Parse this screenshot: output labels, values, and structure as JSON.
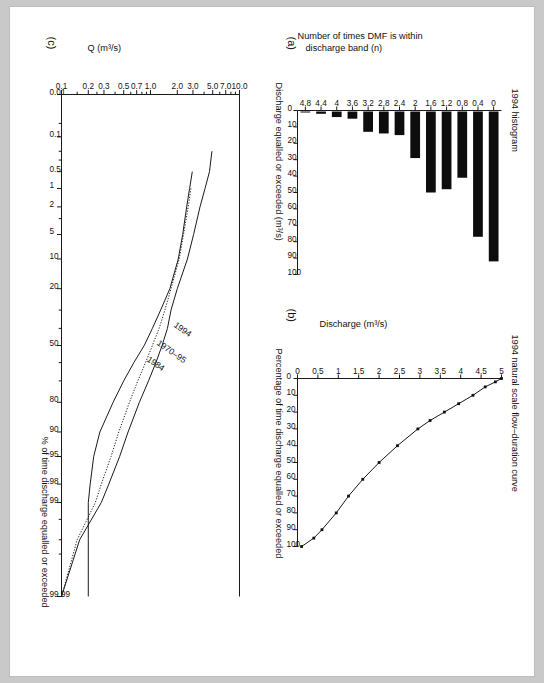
{
  "figure": {
    "orientation_deg": 90,
    "background": "#c9c9c9",
    "paper": "#ffffff",
    "ink": "#1a1a1a"
  },
  "panel_a": {
    "tag": "(a)",
    "title": "1994 histogram",
    "ylabel_line1": "Number of times DMF is within",
    "ylabel_line2": "discharge band (n)",
    "xlabel": "Discharge equalled or exceeded (m³/s)",
    "chart_data": {
      "type": "bar",
      "title": "1994 histogram",
      "xlabel": "Discharge equalled or exceeded (m³/s)",
      "ylabel": "Number of times DMF is within discharge band (n)",
      "categories": [
        "0",
        "0.4",
        "0.8",
        "1.2",
        "1.6",
        "2",
        "2.4",
        "2.8",
        "3.2",
        "3.6",
        "4",
        "4.4",
        "4.8"
      ],
      "values": [
        92,
        77,
        41,
        48,
        50,
        29,
        15,
        14,
        13,
        5,
        4,
        2,
        1
      ],
      "ylim": [
        0,
        100
      ],
      "yticks": [
        0,
        10,
        20,
        30,
        40,
        50,
        60,
        70,
        80,
        90,
        100
      ],
      "xticks": [
        "0",
        "0.4",
        "0.8",
        "1.2",
        "1.6",
        "2",
        "2.4",
        "2.8",
        "3.2",
        "3.6",
        "4",
        "4.4",
        "4.8"
      ],
      "grid": false,
      "legend": "none"
    }
  },
  "panel_b": {
    "tag": "(b)",
    "title": "1994 natural scale flow–duration curve",
    "ylabel": "Discharge (m³/s)",
    "xlabel": "Percentage of time discharge equalled or exceeded",
    "chart_data": {
      "type": "line",
      "title": "1994 natural scale flow–duration curve",
      "xlabel": "Percentage of time discharge equalled or exceeded",
      "ylabel": "Discharge (m³/s)",
      "xlim": [
        0,
        100
      ],
      "ylim": [
        0,
        5
      ],
      "xticks": [
        0,
        10,
        20,
        30,
        40,
        50,
        60,
        70,
        80,
        90,
        100
      ],
      "yticks": [
        "0",
        "0.5",
        "1",
        "1.5",
        "2",
        "2.5",
        "3",
        "3.5",
        "4",
        "4.5",
        "5"
      ],
      "grid": false,
      "legend": "none",
      "series": [
        {
          "name": "1994",
          "x": [
            0,
            2,
            5,
            10,
            15,
            20,
            25,
            30,
            40,
            50,
            60,
            70,
            80,
            90,
            95,
            100
          ],
          "y": [
            5.0,
            4.85,
            4.6,
            4.3,
            3.95,
            3.6,
            3.25,
            2.95,
            2.45,
            2.0,
            1.6,
            1.25,
            0.95,
            0.6,
            0.4,
            0.1
          ]
        }
      ]
    }
  },
  "panel_c": {
    "tag": "(c)",
    "ylabel": "Q (m³/s)",
    "xlabel": "% of time discharge equalled or exceeded",
    "chart_data": {
      "type": "line",
      "title": "",
      "xlabel": "% of time discharge equalled or exceeded",
      "ylabel": "Q (m³/s)",
      "x_scale": "normal-probability",
      "y_scale": "log",
      "xlim": [
        0.01,
        99.99
      ],
      "ylim": [
        0.1,
        10.0
      ],
      "xticks": [
        "0.01",
        "0.1",
        "0.5",
        "1",
        "2",
        "5",
        "10",
        "20",
        "50",
        "80",
        "90",
        "95",
        "98",
        "99",
        "99.99"
      ],
      "yticks": [
        "10.0",
        "7.0",
        "5.0",
        "3.0",
        "2.0",
        "1.0",
        "0.7",
        "0.5",
        "0.3",
        "0.2",
        "0.1"
      ],
      "grid": false,
      "legend": "inline-annotations",
      "annotations": [
        {
          "text": "1994",
          "x": 42,
          "y": 2.2
        },
        {
          "text": "1970–95",
          "x": 55,
          "y": 1.65
        },
        {
          "text": "1984",
          "x": 62,
          "y": 1.1
        }
      ],
      "series": [
        {
          "name": "1994",
          "style": "solid",
          "x": [
            0.2,
            0.5,
            1,
            2,
            5,
            10,
            20,
            30,
            40,
            50,
            60,
            70,
            80,
            90,
            95,
            98,
            99,
            99.8,
            99.99
          ],
          "y": [
            4.9,
            4.6,
            4.1,
            3.6,
            3.05,
            2.6,
            2.0,
            1.7,
            1.55,
            1.35,
            1.15,
            0.95,
            0.75,
            0.56,
            0.45,
            0.34,
            0.28,
            0.16,
            0.1
          ]
        },
        {
          "name": "1970–95",
          "style": "dotted",
          "x": [
            1,
            2,
            5,
            10,
            20,
            30,
            40,
            50,
            60,
            70,
            80,
            90,
            95,
            98,
            99,
            99.8,
            99.99
          ],
          "y": [
            2.85,
            2.65,
            2.35,
            2.1,
            1.7,
            1.45,
            1.25,
            1.05,
            0.88,
            0.72,
            0.58,
            0.44,
            0.36,
            0.28,
            0.24,
            0.15,
            0.1
          ]
        },
        {
          "name": "1984",
          "style": "solid",
          "x": [
            0.5,
            1,
            2,
            5,
            10,
            20,
            30,
            40,
            50,
            60,
            70,
            80,
            90,
            95,
            98,
            99,
            99.8,
            99.99
          ],
          "y": [
            2.95,
            2.75,
            2.55,
            2.3,
            2.05,
            1.65,
            1.3,
            1.05,
            0.85,
            0.65,
            0.5,
            0.38,
            0.27,
            0.23,
            0.21,
            0.2,
            0.2,
            0.2
          ]
        }
      ]
    }
  }
}
